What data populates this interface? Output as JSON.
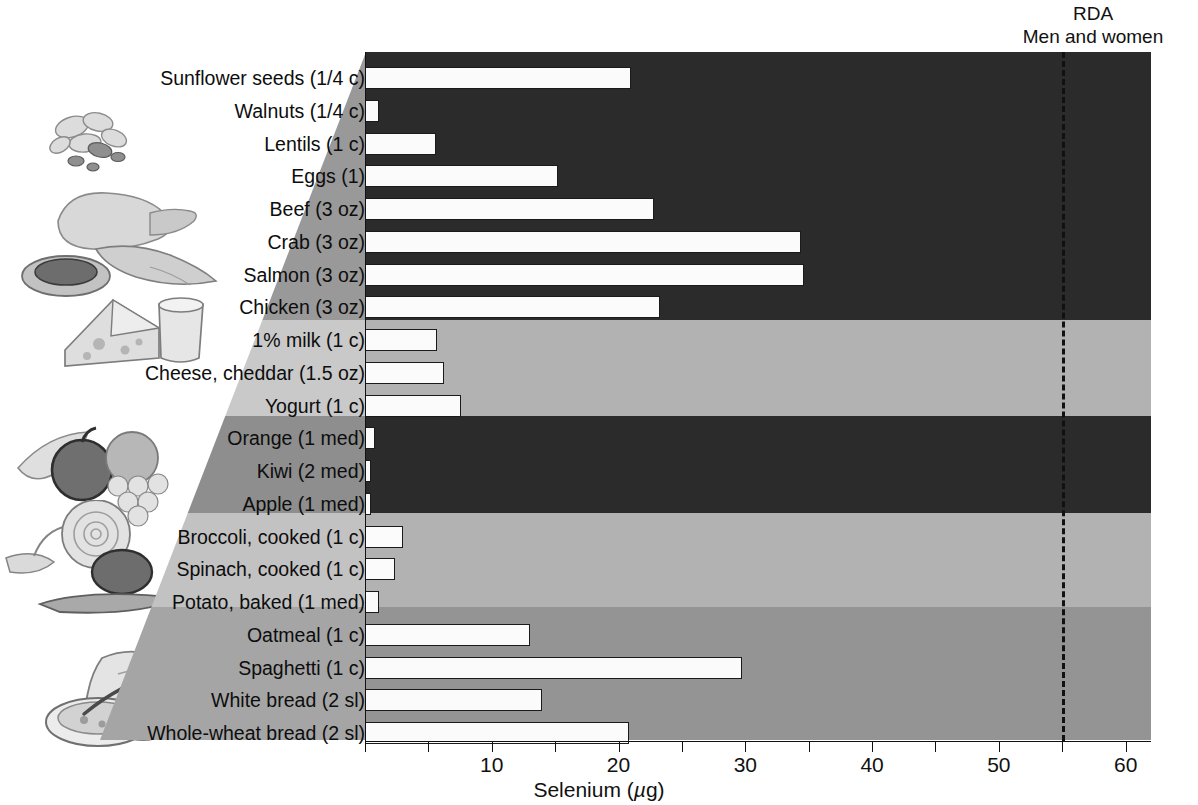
{
  "annotations": {
    "rda_line1": "RDA",
    "rda_line2": "Men and women",
    "rda_value": 55
  },
  "chart_data": {
    "type": "bar",
    "orientation": "horizontal",
    "title": "",
    "xlabel": "Selenium (µg)",
    "ylabel": "",
    "xlim": [
      0,
      62
    ],
    "xticks": [
      0,
      5,
      10,
      15,
      20,
      25,
      30,
      35,
      40,
      45,
      50,
      55,
      60
    ],
    "xticklabels": [
      "",
      "",
      "10",
      "",
      "20",
      "",
      "30",
      "",
      "40",
      "",
      "50",
      "",
      "60"
    ],
    "grid": false,
    "legend": "none",
    "reference_line": {
      "label": "RDA Men and women",
      "value": 55,
      "style": "dashed"
    },
    "groups": [
      {
        "name": "Protein foods",
        "band_color": "#2b2b2b",
        "count": 8
      },
      {
        "name": "Dairy",
        "band_color": "#b2b2b2",
        "count": 3
      },
      {
        "name": "Fruits",
        "band_color": "#2b2b2b",
        "count": 3
      },
      {
        "name": "Vegetables",
        "band_color": "#b2b2b2",
        "count": 3
      },
      {
        "name": "Grains",
        "band_color": "#949494",
        "count": 4
      }
    ],
    "categories": [
      "Sunflower seeds (1/4 c)",
      "Walnuts (1/4 c)",
      "Lentils (1 c)",
      "Eggs (1)",
      "Beef (3 oz)",
      "Crab (3 oz)",
      "Salmon (3 oz)",
      "Chicken (3 oz)",
      "1% milk (1 c)",
      "Cheese, cheddar (1.5 oz)",
      "Yogurt (1 c)",
      "Orange (1 med)",
      "Kiwi (2 med)",
      "Apple (1 med)",
      "Broccoli, cooked (1 c)",
      "Spinach, cooked (1 c)",
      "Potato, baked (1 med)",
      "Oatmeal (1 c)",
      "Spaghetti (1 c)",
      "White bread (2 sl)",
      "Whole-wheat bread (2 sl)"
    ],
    "values": [
      21.0,
      1.1,
      5.6,
      15.2,
      22.8,
      34.4,
      34.6,
      23.3,
      5.7,
      6.2,
      7.6,
      0.8,
      0.5,
      0.5,
      3.0,
      2.4,
      1.1,
      13.0,
      29.7,
      14.0,
      20.8
    ]
  },
  "colors": {
    "band_dark": "#2b2b2b",
    "band_light": "#b2b2b2",
    "band_medium": "#949494",
    "bar_fill": "#fbfbfb",
    "bar_stroke": "#1a1a1a",
    "axis": "#111111"
  }
}
